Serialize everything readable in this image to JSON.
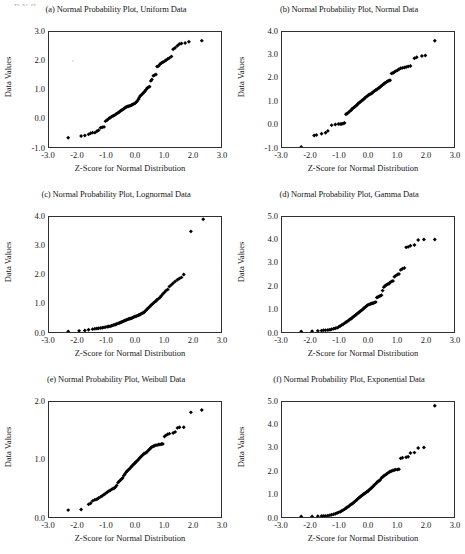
{
  "page": {
    "top_sliver_text": "p      y           g"
  },
  "figure": {
    "shared_xlabel": "Z-Score for Normal Distribution",
    "shared_ylabel": "Data Values",
    "marker_color": "#000000",
    "axis_color": "#303030",
    "background_color": "#ffffff"
  },
  "chart_data": [
    {
      "id": "panel-a",
      "type": "scatter",
      "title": "(a) Normal Probability Plot, Uniform Data",
      "xlabel": "Z-Score for Normal Distribution",
      "ylabel": "Data Values",
      "xlim": [
        -3.0,
        3.0
      ],
      "ylim": [
        -1.0,
        3.0
      ],
      "xticks": [
        -3.0,
        -2.0,
        -1.0,
        0.0,
        1.0,
        2.0,
        3.0
      ],
      "yticks": [
        -1.0,
        0.0,
        1.0,
        2.0,
        3.0
      ],
      "xtick_labels": [
        "-3.0",
        "-2.0",
        "-1.0",
        "0.0",
        "1.0",
        "2.0",
        "3.0"
      ],
      "ytick_labels": [
        "-1.0",
        "0.0",
        "1.0",
        "2.0",
        "3.0"
      ],
      "grid": false,
      "legend": null,
      "x": [
        -2.33,
        -1.88,
        -1.75,
        -1.62,
        -1.55,
        -1.48,
        -1.4,
        -1.33,
        -1.27,
        -1.2,
        -1.14,
        -1.08,
        -1.03,
        -0.97,
        -0.92,
        -0.87,
        -0.82,
        -0.77,
        -0.73,
        -0.68,
        -0.64,
        -0.59,
        -0.55,
        -0.51,
        -0.47,
        -0.43,
        -0.39,
        -0.35,
        -0.31,
        -0.27,
        -0.23,
        -0.19,
        -0.15,
        -0.12,
        -0.08,
        -0.04,
        0.0,
        0.04,
        0.08,
        0.12,
        0.15,
        0.19,
        0.23,
        0.27,
        0.31,
        0.35,
        0.39,
        0.43,
        0.47,
        0.51,
        0.55,
        0.59,
        0.64,
        0.68,
        0.73,
        0.77,
        0.82,
        0.87,
        0.92,
        0.97,
        1.03,
        1.08,
        1.14,
        1.2,
        1.27,
        1.33,
        1.4,
        1.48,
        1.55,
        1.62,
        1.75,
        1.88,
        2.33
      ],
      "y": [
        -0.68,
        -0.62,
        -0.6,
        -0.56,
        -0.52,
        -0.5,
        -0.5,
        -0.45,
        -0.42,
        -0.33,
        -0.31,
        -0.3,
        -0.1,
        -0.06,
        -0.02,
        0.02,
        0.05,
        0.08,
        0.1,
        0.13,
        0.16,
        0.19,
        0.22,
        0.25,
        0.28,
        0.3,
        0.33,
        0.36,
        0.39,
        0.41,
        0.42,
        0.43,
        0.44,
        0.46,
        0.48,
        0.5,
        0.52,
        0.56,
        0.6,
        0.66,
        0.72,
        0.78,
        0.82,
        0.86,
        0.9,
        0.95,
        1.0,
        1.05,
        1.08,
        1.1,
        1.3,
        1.35,
        1.48,
        1.5,
        1.52,
        1.8,
        1.82,
        1.88,
        1.92,
        1.95,
        1.98,
        2.02,
        2.06,
        2.1,
        2.15,
        2.4,
        2.45,
        2.52,
        2.58,
        2.6,
        2.62,
        2.66,
        2.7
      ]
    },
    {
      "id": "panel-b",
      "type": "scatter",
      "title": "(b) Normal Probability Plot, Normal Data",
      "xlabel": "Z-Score for Normal Distribution",
      "ylabel": "Data Values",
      "xlim": [
        -3.0,
        3.0
      ],
      "ylim": [
        -1.0,
        4.0
      ],
      "xticks": [
        -3.0,
        -2.0,
        -1.0,
        0.0,
        1.0,
        2.0,
        3.0
      ],
      "yticks": [
        -1.0,
        0.0,
        1.0,
        2.0,
        3.0,
        4.0
      ],
      "xtick_labels": [
        "-3.0",
        "-2.0",
        "-1.0",
        "0.0",
        "1.0",
        "2.0",
        "3.0"
      ],
      "ytick_labels": [
        "-1.0",
        "0.0",
        "1.0",
        "2.0",
        "3.0",
        "4.0"
      ],
      "grid": false,
      "legend": null,
      "x": [
        -2.33,
        -1.88,
        -1.8,
        -1.62,
        -1.48,
        -1.4,
        -1.27,
        -1.14,
        -1.03,
        -0.97,
        -0.92,
        -0.87,
        -0.82,
        -0.77,
        -0.73,
        -0.68,
        -0.64,
        -0.59,
        -0.55,
        -0.51,
        -0.47,
        -0.43,
        -0.39,
        -0.35,
        -0.31,
        -0.27,
        -0.23,
        -0.19,
        -0.15,
        -0.12,
        -0.08,
        -0.04,
        0.0,
        0.04,
        0.08,
        0.12,
        0.15,
        0.19,
        0.23,
        0.27,
        0.31,
        0.35,
        0.39,
        0.43,
        0.47,
        0.51,
        0.55,
        0.59,
        0.64,
        0.68,
        0.73,
        0.77,
        0.82,
        0.87,
        0.92,
        0.97,
        1.03,
        1.08,
        1.14,
        1.2,
        1.27,
        1.33,
        1.4,
        1.48,
        1.62,
        1.7,
        1.88,
        2.0,
        2.33
      ],
      "y": [
        -1.0,
        -0.5,
        -0.48,
        -0.42,
        -0.38,
        -0.3,
        -0.05,
        -0.02,
        0.0,
        0.0,
        0.0,
        0.02,
        0.04,
        0.42,
        0.46,
        0.5,
        0.55,
        0.6,
        0.66,
        0.7,
        0.74,
        0.78,
        0.82,
        0.88,
        0.92,
        0.96,
        1.0,
        1.04,
        1.08,
        1.12,
        1.16,
        1.2,
        1.24,
        1.28,
        1.3,
        1.33,
        1.36,
        1.4,
        1.44,
        1.48,
        1.5,
        1.54,
        1.58,
        1.62,
        1.66,
        1.7,
        1.74,
        1.78,
        1.82,
        1.86,
        1.88,
        1.9,
        2.2,
        2.22,
        2.26,
        2.3,
        2.34,
        2.38,
        2.42,
        2.44,
        2.46,
        2.48,
        2.5,
        2.52,
        2.86,
        2.9,
        2.96,
        2.98,
        3.62
      ]
    },
    {
      "id": "panel-c",
      "type": "scatter",
      "title": "(c) Normal Probability Plot, Lognormal Data",
      "xlabel": "Z-Score for Normal Distribution",
      "ylabel": "Data Values",
      "xlim": [
        -3.0,
        3.0
      ],
      "ylim": [
        0.0,
        4.0
      ],
      "xticks": [
        -3.0,
        -2.0,
        -1.0,
        0.0,
        1.0,
        2.0,
        3.0
      ],
      "yticks": [
        0.0,
        1.0,
        2.0,
        3.0,
        4.0
      ],
      "xtick_labels": [
        "-3.0",
        "-2.0",
        "-1.0",
        "0.0",
        "1.0",
        "2.0",
        "3.0"
      ],
      "ytick_labels": [
        "0.0",
        "1.0",
        "2.0",
        "3.0",
        "4.0"
      ],
      "grid": false,
      "legend": null,
      "x": [
        -2.33,
        -1.95,
        -1.75,
        -1.62,
        -1.48,
        -1.4,
        -1.33,
        -1.27,
        -1.2,
        -1.14,
        -1.08,
        -1.03,
        -0.97,
        -0.92,
        -0.87,
        -0.82,
        -0.77,
        -0.73,
        -0.68,
        -0.64,
        -0.59,
        -0.55,
        -0.51,
        -0.47,
        -0.43,
        -0.39,
        -0.35,
        -0.31,
        -0.27,
        -0.23,
        -0.19,
        -0.15,
        -0.12,
        -0.08,
        -0.04,
        0.0,
        0.04,
        0.08,
        0.12,
        0.15,
        0.19,
        0.23,
        0.27,
        0.31,
        0.35,
        0.39,
        0.43,
        0.47,
        0.51,
        0.55,
        0.59,
        0.64,
        0.68,
        0.73,
        0.77,
        0.82,
        0.87,
        0.92,
        0.97,
        1.03,
        1.08,
        1.14,
        1.2,
        1.27,
        1.33,
        1.4,
        1.48,
        1.55,
        1.62,
        1.7,
        1.95,
        2.38
      ],
      "y": [
        0.02,
        0.04,
        0.05,
        0.08,
        0.1,
        0.11,
        0.12,
        0.13,
        0.14,
        0.15,
        0.16,
        0.17,
        0.18,
        0.19,
        0.2,
        0.22,
        0.23,
        0.25,
        0.26,
        0.28,
        0.3,
        0.31,
        0.33,
        0.35,
        0.36,
        0.38,
        0.4,
        0.42,
        0.43,
        0.45,
        0.46,
        0.47,
        0.48,
        0.5,
        0.52,
        0.54,
        0.55,
        0.57,
        0.58,
        0.6,
        0.62,
        0.64,
        0.66,
        0.68,
        0.72,
        0.76,
        0.8,
        0.84,
        0.88,
        0.92,
        0.96,
        1.0,
        1.04,
        1.08,
        1.12,
        1.16,
        1.2,
        1.26,
        1.32,
        1.38,
        1.44,
        1.48,
        1.58,
        1.64,
        1.7,
        1.76,
        1.82,
        1.86,
        1.9,
        2.0,
        3.5,
        3.92
      ]
    },
    {
      "id": "panel-d",
      "type": "scatter",
      "title": "(d) Normal Probability Plot, Gamma Data",
      "xlabel": "Z-Score for Normal Distribution",
      "ylabel": "Data Values",
      "xlim": [
        -3.0,
        3.0
      ],
      "ylim": [
        0.0,
        5.0
      ],
      "xticks": [
        -3.0,
        -2.0,
        -1.0,
        0.0,
        1.0,
        2.0,
        3.0
      ],
      "yticks": [
        0.0,
        1.0,
        2.0,
        3.0,
        4.0,
        5.0
      ],
      "xtick_labels": [
        "-3.0",
        "-2.0",
        "-1.0",
        "0.0",
        "1.0",
        "2.0",
        "3.0"
      ],
      "ytick_labels": [
        "0.0",
        "1.0",
        "2.0",
        "3.0",
        "4.0",
        "5.0"
      ],
      "grid": false,
      "legend": null,
      "x": [
        -2.33,
        -1.95,
        -1.75,
        -1.62,
        -1.55,
        -1.48,
        -1.4,
        -1.33,
        -1.27,
        -1.2,
        -1.14,
        -1.08,
        -1.03,
        -0.97,
        -0.92,
        -0.87,
        -0.82,
        -0.77,
        -0.73,
        -0.68,
        -0.64,
        -0.59,
        -0.55,
        -0.51,
        -0.47,
        -0.43,
        -0.39,
        -0.35,
        -0.31,
        -0.27,
        -0.23,
        -0.19,
        -0.15,
        -0.12,
        -0.08,
        -0.04,
        0.0,
        0.04,
        0.08,
        0.12,
        0.15,
        0.19,
        0.23,
        0.27,
        0.31,
        0.35,
        0.39,
        0.43,
        0.47,
        0.51,
        0.55,
        0.59,
        0.64,
        0.68,
        0.73,
        0.77,
        0.82,
        0.87,
        0.92,
        0.97,
        1.03,
        1.08,
        1.14,
        1.2,
        1.27,
        1.33,
        1.4,
        1.48,
        1.62,
        1.75,
        1.95,
        2.33
      ],
      "y": [
        0.02,
        0.03,
        0.05,
        0.06,
        0.08,
        0.08,
        0.09,
        0.1,
        0.12,
        0.14,
        0.16,
        0.18,
        0.22,
        0.26,
        0.3,
        0.34,
        0.38,
        0.42,
        0.46,
        0.5,
        0.54,
        0.58,
        0.62,
        0.66,
        0.7,
        0.74,
        0.78,
        0.82,
        0.86,
        0.9,
        0.94,
        0.98,
        1.02,
        1.06,
        1.1,
        1.14,
        1.18,
        1.2,
        1.22,
        1.24,
        1.25,
        1.26,
        1.28,
        1.3,
        1.5,
        1.52,
        1.55,
        1.58,
        1.6,
        1.8,
        1.95,
        2.0,
        2.05,
        2.08,
        2.1,
        2.15,
        2.2,
        2.22,
        2.4,
        2.45,
        2.5,
        2.52,
        2.7,
        2.75,
        2.78,
        3.68,
        3.7,
        3.75,
        3.78,
        4.0,
        4.02,
        4.02
      ]
    },
    {
      "id": "panel-e",
      "type": "scatter",
      "title": "(e) Normal Probability Plot, Weibull Data",
      "xlabel": "Z-Score for Normal Distribution",
      "ylabel": "Data Values",
      "xlim": [
        -3.0,
        3.0
      ],
      "ylim": [
        0.0,
        2.0
      ],
      "xticks": [
        -3.0,
        -2.0,
        -1.0,
        0.0,
        1.0,
        2.0,
        3.0
      ],
      "yticks": [
        0.0,
        1.0,
        2.0
      ],
      "xtick_labels": [
        "-3.0",
        "-2.0",
        "-1.0",
        "0.0",
        "1.0",
        "2.0",
        "3.0"
      ],
      "ytick_labels": [
        "0.0",
        "1.0",
        "2.0"
      ],
      "grid": false,
      "legend": null,
      "x": [
        -2.33,
        -1.88,
        -1.62,
        -1.55,
        -1.48,
        -1.4,
        -1.33,
        -1.27,
        -1.2,
        -1.14,
        -1.08,
        -1.03,
        -0.97,
        -0.92,
        -0.87,
        -0.82,
        -0.77,
        -0.73,
        -0.68,
        -0.64,
        -0.59,
        -0.55,
        -0.51,
        -0.47,
        -0.43,
        -0.39,
        -0.35,
        -0.31,
        -0.27,
        -0.23,
        -0.19,
        -0.15,
        -0.12,
        -0.08,
        -0.04,
        0.0,
        0.04,
        0.08,
        0.12,
        0.15,
        0.19,
        0.23,
        0.27,
        0.31,
        0.35,
        0.39,
        0.43,
        0.47,
        0.51,
        0.55,
        0.59,
        0.64,
        0.68,
        0.73,
        0.77,
        0.82,
        0.87,
        0.92,
        0.97,
        1.03,
        1.08,
        1.14,
        1.2,
        1.33,
        1.4,
        1.48,
        1.55,
        1.7,
        1.95,
        2.33
      ],
      "y": [
        0.12,
        0.13,
        0.22,
        0.24,
        0.28,
        0.3,
        0.31,
        0.33,
        0.35,
        0.37,
        0.39,
        0.41,
        0.43,
        0.45,
        0.46,
        0.48,
        0.49,
        0.5,
        0.52,
        0.55,
        0.6,
        0.62,
        0.64,
        0.66,
        0.68,
        0.72,
        0.75,
        0.78,
        0.8,
        0.82,
        0.84,
        0.86,
        0.88,
        0.9,
        0.92,
        0.94,
        0.96,
        0.98,
        1.0,
        1.02,
        1.04,
        1.06,
        1.08,
        1.1,
        1.11,
        1.12,
        1.14,
        1.16,
        1.18,
        1.2,
        1.22,
        1.23,
        1.24,
        1.25,
        1.25,
        1.26,
        1.26,
        1.27,
        1.27,
        1.4,
        1.42,
        1.44,
        1.45,
        1.46,
        1.48,
        1.55,
        1.56,
        1.56,
        1.82,
        1.86
      ]
    },
    {
      "id": "panel-f",
      "type": "scatter",
      "title": "(f) Normal Probability Plot, Exponential Data",
      "xlabel": "Z-Score for Normal Distribution",
      "ylabel": "Data Values",
      "xlim": [
        -3.0,
        3.0
      ],
      "ylim": [
        0.0,
        5.0
      ],
      "xticks": [
        -3.0,
        -2.0,
        -1.0,
        0.0,
        1.0,
        2.0,
        3.0
      ],
      "yticks": [
        0.0,
        1.0,
        2.0,
        3.0,
        4.0,
        5.0
      ],
      "xtick_labels": [
        "-3.0",
        "-2.0",
        "-1.0",
        "0.0",
        "1.0",
        "2.0",
        "3.0"
      ],
      "ytick_labels": [
        "0.0",
        "1.0",
        "2.0",
        "3.0",
        "4.0",
        "5.0"
      ],
      "grid": false,
      "legend": null,
      "x": [
        -2.33,
        -1.95,
        -1.75,
        -1.62,
        -1.55,
        -1.48,
        -1.4,
        -1.33,
        -1.27,
        -1.2,
        -1.14,
        -1.08,
        -1.03,
        -0.97,
        -0.92,
        -0.87,
        -0.82,
        -0.77,
        -0.73,
        -0.68,
        -0.64,
        -0.59,
        -0.55,
        -0.51,
        -0.47,
        -0.43,
        -0.39,
        -0.35,
        -0.31,
        -0.27,
        -0.23,
        -0.19,
        -0.15,
        -0.12,
        -0.08,
        -0.04,
        0.0,
        0.04,
        0.08,
        0.12,
        0.15,
        0.19,
        0.23,
        0.27,
        0.31,
        0.35,
        0.39,
        0.43,
        0.47,
        0.51,
        0.55,
        0.59,
        0.64,
        0.68,
        0.73,
        0.77,
        0.82,
        0.87,
        0.92,
        0.97,
        1.03,
        1.08,
        1.14,
        1.2,
        1.33,
        1.4,
        1.48,
        1.62,
        1.75,
        1.95,
        2.33
      ],
      "y": [
        0.02,
        0.02,
        0.03,
        0.04,
        0.04,
        0.05,
        0.06,
        0.08,
        0.1,
        0.12,
        0.14,
        0.17,
        0.2,
        0.23,
        0.26,
        0.3,
        0.34,
        0.38,
        0.42,
        0.46,
        0.5,
        0.55,
        0.58,
        0.62,
        0.66,
        0.7,
        0.75,
        0.8,
        0.84,
        0.88,
        0.92,
        0.96,
        1.0,
        1.02,
        1.05,
        1.1,
        1.12,
        1.18,
        1.22,
        1.26,
        1.3,
        1.35,
        1.4,
        1.45,
        1.5,
        1.55,
        1.58,
        1.62,
        1.7,
        1.74,
        1.78,
        1.82,
        1.86,
        1.9,
        1.94,
        1.98,
        2.0,
        2.02,
        2.04,
        2.06,
        2.06,
        2.08,
        2.55,
        2.58,
        2.6,
        2.62,
        2.78,
        2.8,
        3.0,
        3.02,
        4.84
      ]
    }
  ]
}
